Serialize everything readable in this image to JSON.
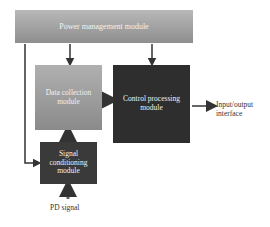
{
  "blocks": {
    "power": "Power management module",
    "data_collection": "Data collection module",
    "control": "Control processing module",
    "signal": "Signal conditioning module"
  },
  "labels": {
    "io": "Input/output interface",
    "pd": "PD signal"
  },
  "colors": {
    "power": "#a3a3a3",
    "data_collection": "#9d9d9d",
    "control": "#2e2e2e",
    "signal": "#3a3a3a",
    "arrow": "#333333"
  }
}
